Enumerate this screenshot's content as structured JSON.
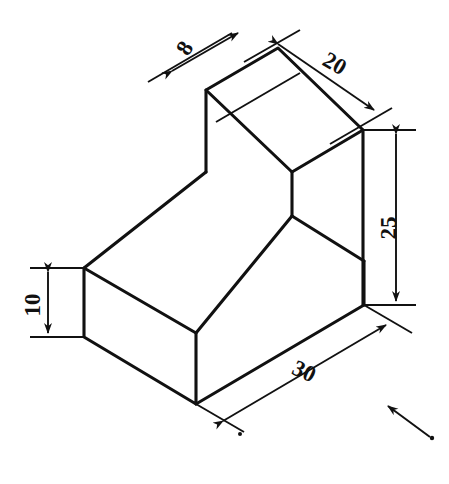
{
  "drawing": {
    "title": "Isometric view of L-shaped bracket",
    "background_color": "#ffffff",
    "line_color": "#111111",
    "projection": "isometric",
    "units": "mm"
  },
  "dimensions": [
    {
      "id": "depth-8",
      "label": "8",
      "value": 8,
      "feature": "upright wall thickness",
      "rotation": -58,
      "x": 191,
      "y": 52
    },
    {
      "id": "width-20",
      "label": "20",
      "value": 20,
      "feature": "top face width",
      "rotation": 30,
      "x": 331,
      "y": 70
    },
    {
      "id": "height-25",
      "label": "25",
      "value": 25,
      "feature": "overall height of upright",
      "rotation": -90,
      "x": 396,
      "y": 228
    },
    {
      "id": "height-10",
      "label": "10",
      "value": 10,
      "feature": "base slab thickness",
      "rotation": -90,
      "x": 40,
      "y": 305
    },
    {
      "id": "length-30",
      "label": "30",
      "value": 30,
      "feature": "base length",
      "rotation": 25,
      "x": 301,
      "y": 378
    }
  ],
  "annotations": [
    {
      "id": "view-direction-arrow",
      "type": "arrow",
      "description": "viewing direction arrow pointing up-left"
    }
  ],
  "geometry": {
    "vertices": {
      "top_back_left": [
        206,
        90
      ],
      "top_back_top": [
        278,
        48
      ],
      "top_right": [
        363,
        130
      ],
      "top_front": [
        292,
        172
      ],
      "upright_front_bottom": [
        292,
        216
      ],
      "seat_left": [
        84,
        268
      ],
      "seat_front": [
        196,
        333
      ],
      "upright_left_bottom": [
        206,
        172
      ],
      "base_left_bottom": [
        84,
        337
      ],
      "base_front_bottom": [
        196,
        404
      ],
      "base_right_top": [
        364,
        261
      ],
      "base_right_bottom": [
        364,
        305
      ],
      "upright_right_bottom": [
        363,
        261
      ]
    }
  }
}
